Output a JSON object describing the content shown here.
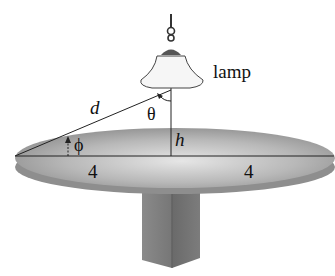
{
  "diagram": {
    "labels": {
      "lamp": "lamp",
      "distance": "d",
      "theta": "θ",
      "phi": "ϕ",
      "height": "h",
      "radius_left": "4",
      "radius_right": "4"
    },
    "colors": {
      "background": "#ffffff",
      "disk_top": "#b3b3b3",
      "disk_edge": "#8c8c8c",
      "column": "#7a7a7a",
      "shade": "#f4f4f4",
      "lines": "#222222"
    }
  }
}
